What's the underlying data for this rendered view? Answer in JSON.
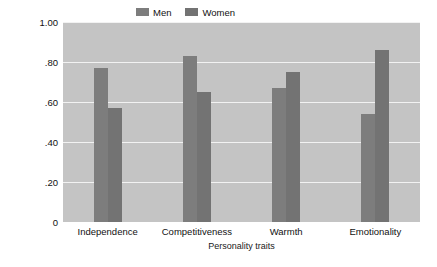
{
  "chart_data": {
    "type": "bar",
    "title": "",
    "subtitle": "",
    "xlabel": "Personality traits",
    "ylabel": "Judged probability",
    "categories": [
      "Independence",
      "Competitiveness",
      "Warmth",
      "Emotionality"
    ],
    "series": [
      {
        "name": "Men",
        "values": [
          0.77,
          0.83,
          0.67,
          0.54
        ],
        "color": "#7d7d7d"
      },
      {
        "name": "Women",
        "values": [
          0.57,
          0.65,
          0.75,
          0.86
        ],
        "color": "#737373"
      }
    ],
    "ylim": [
      0,
      1.0
    ],
    "ytick_values": [
      1.0,
      0.8,
      0.6,
      0.4,
      0.2,
      0
    ],
    "ytick_labels": [
      "1.00",
      ".80",
      ".60",
      ".40",
      ".20",
      "0"
    ],
    "grid": true,
    "grid_color": "#f2f2f2",
    "plot_background": "#c4c4c4",
    "figure_background": "#ffffff",
    "legend_position": "top-center",
    "legend_entries": [
      "Men",
      "Women"
    ]
  }
}
